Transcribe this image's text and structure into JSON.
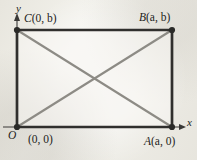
{
  "figure": {
    "background_color": "#f1f0ea",
    "edge_color": "#302f2d",
    "diagonal_color": "#8d8b85",
    "axis_color": "#3a3937",
    "rectangle": {
      "origin_px": [
        17,
        127
      ],
      "width_px": 155,
      "height_px": 97,
      "vertices_px": {
        "O": [
          17,
          127
        ],
        "A": [
          172,
          127
        ],
        "B": [
          172,
          30
        ],
        "C": [
          17,
          30
        ]
      }
    },
    "diagonals": {
      "intersection_px": [
        94,
        78
      ],
      "lines": [
        [
          "O",
          "B"
        ],
        [
          "C",
          "A"
        ]
      ]
    },
    "axes": {
      "y_axis": {
        "from_px": [
          17,
          127
        ],
        "to_px": [
          17,
          14
        ],
        "arrow": true
      },
      "x_axis": {
        "from_px": [
          5,
          127
        ],
        "to_px": [
          186,
          127
        ],
        "arrow": true
      }
    }
  },
  "labels": {
    "y_axis": "y",
    "x_axis": "x",
    "vertex_C": {
      "name": "C",
      "coords": "(0, b)"
    },
    "vertex_B": {
      "name": "B",
      "coords": "(a, b)"
    },
    "vertex_A": {
      "name": "A",
      "coords": "(a, 0)"
    },
    "origin_letter": "O",
    "origin_coords": "(0, 0)"
  }
}
